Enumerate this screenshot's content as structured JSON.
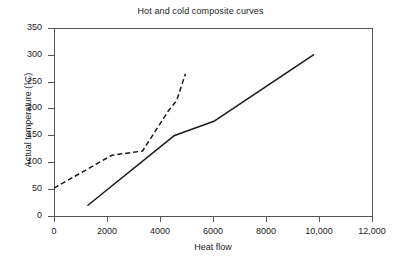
{
  "chart_data": {
    "type": "line",
    "title": "Hot and cold composite curves",
    "xlabel": "Heat flow",
    "ylabel": "Actual temperature (°C)",
    "xlim": [
      0,
      12000
    ],
    "ylim": [
      0,
      350
    ],
    "grid": false,
    "legend": "none",
    "xticks": [
      0,
      2000,
      4000,
      6000,
      8000,
      10000,
      12000
    ],
    "xticklabels": [
      "0",
      "2000",
      "4000",
      "6000",
      "8000",
      "10,000",
      "12,000"
    ],
    "yticks": [
      0,
      50,
      100,
      150,
      200,
      250,
      300,
      350
    ],
    "yticklabels": [
      "0",
      "50",
      "100",
      "150",
      "200",
      "250",
      "300",
      "350"
    ],
    "series": [
      {
        "name": "Hot composite curve",
        "style": "solid",
        "color": "#1a1a1a",
        "points": [
          [
            1280,
            20
          ],
          [
            4550,
            150
          ],
          [
            6060,
            177
          ],
          [
            9790,
            300
          ]
        ]
      },
      {
        "name": "Cold composite curve",
        "style": "dashed",
        "color": "#1a1a1a",
        "points": [
          [
            0,
            52
          ],
          [
            2180,
            113
          ],
          [
            3340,
            121
          ],
          [
            4320,
            196
          ],
          [
            4630,
            215
          ],
          [
            4960,
            265
          ]
        ]
      }
    ]
  },
  "axes": {
    "title": "Hot and cold composite curves",
    "x_title": "Heat flow",
    "y_title": "Actual temperature (°C)"
  }
}
